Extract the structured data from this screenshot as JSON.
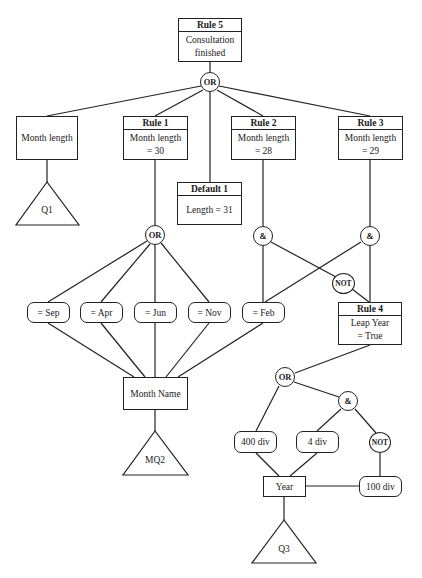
{
  "diagram": {
    "type": "rule-tree",
    "rules": {
      "rule5": {
        "header": "Rule 5",
        "body_line1": "Consultation",
        "body_line2": "finished"
      },
      "rule1": {
        "header": "Rule 1",
        "body_line1": "Month length",
        "body_line2": "= 30"
      },
      "rule2": {
        "header": "Rule 2",
        "body_line1": "Month length",
        "body_line2": "= 28"
      },
      "rule3": {
        "header": "Rule 3",
        "body_line1": "Month length",
        "body_line2": "= 29"
      },
      "rule4": {
        "header": "Rule 4",
        "body_line1": "Leap Year",
        "body_line2": "= True"
      },
      "default1": {
        "header": "Default 1",
        "body_line1": "Length = 31"
      }
    },
    "boxes": {
      "month_length": "Month length",
      "month_name": "Month Name",
      "year": "Year"
    },
    "conditions": {
      "sep": "= Sep",
      "apr": "= Apr",
      "jun": "= Jun",
      "nov": "= Nov",
      "feb": "= Feb",
      "div400": "400 div",
      "div4": "4 div",
      "div100": "100 div"
    },
    "operators": {
      "or_top": "OR",
      "or_mid": "OR",
      "and_left": "&",
      "and_right": "&",
      "not_mid": "NOT",
      "or_low": "OR",
      "and_low": "&",
      "not_low": "NOT"
    },
    "questions": {
      "q1": "Q1",
      "mq2": "MQ2",
      "q3": "Q3"
    },
    "colors": {
      "line": "#222222",
      "background": "#ffffff"
    }
  }
}
